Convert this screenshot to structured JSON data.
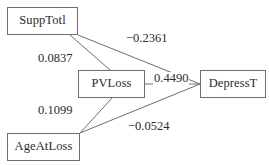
{
  "diagram": {
    "type": "path-diagram",
    "background_color": "#ffffff",
    "line_color": "#6e6e6e",
    "text_color": "#2b2b2b",
    "nodes": [
      {
        "id": "supptotl",
        "label": "SuppTotl",
        "x": 7,
        "y": 7,
        "width": 71,
        "height": 28
      },
      {
        "id": "pvloss",
        "label": "PVLoss",
        "x": 78,
        "y": 70,
        "width": 67,
        "height": 28
      },
      {
        "id": "depresst",
        "label": "DepressT",
        "x": 200,
        "y": 70,
        "width": 66,
        "height": 28
      },
      {
        "id": "ageatloss",
        "label": "AgeAtLoss",
        "x": 7,
        "y": 133,
        "width": 73,
        "height": 28
      }
    ],
    "edges": [
      {
        "id": "supptotl-depresst",
        "from": "SuppTotl",
        "to": "DepressT",
        "value": "−0.2361",
        "numeric": -0.2361,
        "x1": 78,
        "y1": 35,
        "x2": 200,
        "y2": 84
      },
      {
        "id": "supptotl-pvloss",
        "from": "SuppTotl",
        "to": "PVLoss",
        "value": "0.0837",
        "numeric": 0.0837,
        "x1": 70,
        "y1": 35,
        "x2": 110,
        "y2": 70
      },
      {
        "id": "pvloss-depresst",
        "from": "PVLoss",
        "to": "DepressT",
        "value": "0.4490",
        "numeric": 0.449,
        "x1": 145,
        "y1": 84,
        "x2": 200,
        "y2": 84
      },
      {
        "id": "ageatloss-pvloss",
        "from": "AgeAtLoss",
        "to": "PVLoss",
        "value": "0.1099",
        "numeric": 0.1099,
        "x1": 80,
        "y1": 133,
        "x2": 112,
        "y2": 98
      },
      {
        "id": "ageatloss-depresst",
        "from": "AgeAtLoss",
        "to": "DepressT",
        "value": "−0.0524",
        "numeric": -0.0524,
        "x1": 80,
        "y1": 133,
        "x2": 200,
        "y2": 84
      }
    ],
    "edge_labels": [
      {
        "id": "label-supptotl-depresst",
        "text": "−0.2361",
        "x": 125,
        "y": 32
      },
      {
        "id": "label-supptotl-pvloss",
        "text": "0.0837",
        "x": 37,
        "y": 52
      },
      {
        "id": "label-pvloss-depresst",
        "text": "0.4490",
        "x": 153,
        "y": 72
      },
      {
        "id": "label-ageatloss-pvloss",
        "text": "0.1099",
        "x": 37,
        "y": 104
      },
      {
        "id": "label-ageatloss-depresst",
        "text": "−0.0524",
        "x": 127,
        "y": 120
      }
    ]
  }
}
